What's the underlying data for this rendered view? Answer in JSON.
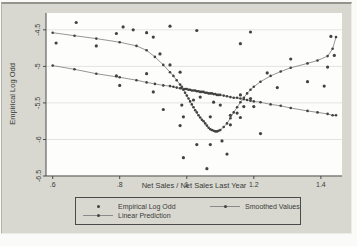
{
  "figure": {
    "type_hint": "stata-style statistical graph",
    "colors": {
      "bg": "#d8d8d0",
      "plot_bg": "#fdfdfc",
      "grid": "#e4e4e0",
      "axis": "#4a4a4a",
      "marker": "#424242",
      "line": "#8a8a8a",
      "text": "#3a3a3a"
    }
  },
  "legend": {
    "items": [
      {
        "label": "Empirical Log Odd",
        "symbol": "dot"
      },
      {
        "label": "Smoothed Values",
        "symbol": "line-dot"
      },
      {
        "label": "Linear Prediction",
        "symbol": "line-dot"
      }
    ]
  },
  "chart_data": {
    "type": "scatter",
    "title": "",
    "xlabel": "Net Sales / Net Sales Last Year",
    "ylabel": "Empirical Log Odd",
    "xlim": [
      0.58,
      1.463
    ],
    "ylim": [
      -6.5,
      -4.27
    ],
    "grid": "horizontal",
    "legend_position": "bottom",
    "xticks": {
      "values": [
        0.6,
        0.8,
        1.0,
        1.2,
        1.4
      ],
      "labels": [
        ".6",
        ".8",
        "1",
        "1.2",
        "1.4"
      ]
    },
    "yticks": {
      "values": [
        -4.5,
        -5.0,
        -5.5,
        -6.0,
        -6.5
      ],
      "labels": [
        "-4.5",
        "-5",
        "-5.5",
        "-6",
        "-6.5"
      ]
    },
    "obs_x": [
      0.6,
      0.665,
      0.73,
      0.8,
      0.85,
      0.88,
      0.905,
      0.93,
      0.95,
      0.96,
      0.97,
      0.98,
      0.985,
      0.99,
      0.995,
      1.0,
      1.005,
      1.01,
      1.015,
      1.02,
      1.025,
      1.03,
      1.035,
      1.04,
      1.045,
      1.05,
      1.055,
      1.06,
      1.065,
      1.07,
      1.075,
      1.08,
      1.085,
      1.09,
      1.095,
      1.1,
      1.11,
      1.12,
      1.13,
      1.14,
      1.15,
      1.16,
      1.17,
      1.18,
      1.19,
      1.2,
      1.22,
      1.25,
      1.28,
      1.31,
      1.36,
      1.39,
      1.42,
      1.435,
      1.445
    ],
    "series": [
      {
        "name": "Empirical Log Odd",
        "type": "scatter",
        "points": [
          [
            0.61,
            -4.68
          ],
          [
            0.67,
            -4.4
          ],
          [
            0.73,
            -4.72
          ],
          [
            0.79,
            -4.55
          ],
          [
            0.81,
            -4.46
          ],
          [
            0.84,
            -4.5
          ],
          [
            0.88,
            -4.54
          ],
          [
            0.9,
            -4.6
          ],
          [
            0.95,
            -4.45
          ],
          [
            1.03,
            -4.51
          ],
          [
            1.16,
            -4.69
          ],
          [
            1.19,
            -4.53
          ],
          [
            0.79,
            -5.13
          ],
          [
            0.8,
            -5.26
          ],
          [
            0.88,
            -5.1
          ],
          [
            0.92,
            -4.83
          ],
          [
            0.95,
            -4.98
          ],
          [
            0.98,
            -5.08
          ],
          [
            0.9,
            -5.35
          ],
          [
            0.93,
            -5.59
          ],
          [
            0.985,
            -5.53
          ],
          [
            0.99,
            -5.69
          ],
          [
            1.02,
            -5.46
          ],
          [
            1.04,
            -5.42
          ],
          [
            1.07,
            -5.69
          ],
          [
            1.08,
            -5.49
          ],
          [
            1.1,
            -5.53
          ],
          [
            1.13,
            -5.67
          ],
          [
            1.13,
            -5.8
          ],
          [
            1.15,
            -5.64
          ],
          [
            1.16,
            -5.7
          ],
          [
            1.16,
            -5.39
          ],
          [
            1.17,
            -5.55
          ],
          [
            1.19,
            -5.44
          ],
          [
            1.2,
            -5.55
          ],
          [
            1.22,
            -5.92
          ],
          [
            0.98,
            -5.81
          ],
          [
            0.99,
            -6.25
          ],
          [
            1.03,
            -6.07
          ],
          [
            1.07,
            -6.07
          ],
          [
            1.105,
            -6.02
          ],
          [
            1.12,
            -6.2
          ],
          [
            1.06,
            -6.4
          ],
          [
            1.24,
            -5.09
          ],
          [
            1.27,
            -5.29
          ],
          [
            1.31,
            -4.9
          ],
          [
            1.36,
            -5.21
          ],
          [
            1.41,
            -5.27
          ],
          [
            1.42,
            -5.01
          ],
          [
            1.43,
            -4.59
          ],
          [
            1.44,
            -4.85
          ]
        ]
      },
      {
        "name": "Smoothed Values",
        "type": "line-marker",
        "y": [
          -4.54,
          -4.58,
          -4.62,
          -4.67,
          -4.72,
          -4.78,
          -4.87,
          -4.98,
          -5.08,
          -5.13,
          -5.19,
          -5.25,
          -5.28,
          -5.32,
          -5.36,
          -5.4,
          -5.44,
          -5.48,
          -5.52,
          -5.56,
          -5.6,
          -5.63,
          -5.67,
          -5.7,
          -5.73,
          -5.75,
          -5.78,
          -5.81,
          -5.84,
          -5.86,
          -5.87,
          -5.88,
          -5.89,
          -5.89,
          -5.88,
          -5.87,
          -5.83,
          -5.78,
          -5.71,
          -5.63,
          -5.56,
          -5.49,
          -5.43,
          -5.37,
          -5.32,
          -5.28,
          -5.21,
          -5.13,
          -5.07,
          -5.02,
          -4.96,
          -4.92,
          -4.86,
          -4.76,
          -4.6
        ]
      },
      {
        "name": "Linear Prediction",
        "type": "line-marker",
        "y": [
          -4.99,
          -5.04,
          -5.1,
          -5.15,
          -5.19,
          -5.22,
          -5.24,
          -5.26,
          -5.27,
          -5.28,
          -5.29,
          -5.3,
          -5.3,
          -5.31,
          -5.31,
          -5.31,
          -5.32,
          -5.32,
          -5.33,
          -5.33,
          -5.33,
          -5.34,
          -5.34,
          -5.35,
          -5.35,
          -5.35,
          -5.36,
          -5.36,
          -5.37,
          -5.37,
          -5.37,
          -5.38,
          -5.38,
          -5.39,
          -5.39,
          -5.39,
          -5.4,
          -5.41,
          -5.42,
          -5.43,
          -5.43,
          -5.44,
          -5.45,
          -5.46,
          -5.47,
          -5.48,
          -5.49,
          -5.52,
          -5.54,
          -5.57,
          -5.61,
          -5.63,
          -5.65,
          -5.67,
          -5.67
        ]
      }
    ]
  }
}
